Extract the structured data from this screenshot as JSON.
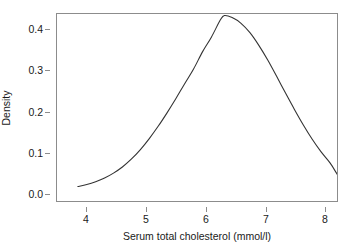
{
  "chart_data": {
    "type": "line",
    "title": "",
    "subtitle": "",
    "xlabel": "Serum total cholesterol (mmol/l)",
    "ylabel": "Density",
    "xlim": [
      3.72,
      8.45
    ],
    "ylim": [
      0.0,
      0.458
    ],
    "xticks": [
      4,
      5,
      6,
      7,
      8
    ],
    "xtick_labels": [
      "4",
      "5",
      "6",
      "7",
      "8"
    ],
    "yticks": [
      0.0,
      0.1,
      0.2,
      0.3,
      0.4
    ],
    "ytick_labels": [
      "0.0",
      "0.1",
      "0.2",
      "0.3",
      "0.4"
    ],
    "grid": false,
    "legend": null,
    "annotations": [],
    "series": [
      {
        "name": "Density",
        "color": "#333333",
        "linewidth": 1.1,
        "x": [
          3.85,
          4.0,
          4.15,
          4.3,
          4.45,
          4.6,
          4.75,
          4.9,
          5.05,
          5.2,
          5.35,
          5.5,
          5.65,
          5.8,
          5.95,
          6.1,
          6.25,
          6.32,
          6.45,
          6.6,
          6.75,
          6.9,
          7.05,
          7.2,
          7.35,
          7.5,
          7.65,
          7.8,
          7.95,
          8.1,
          8.25,
          8.35
        ],
        "y": [
          0.016,
          0.021,
          0.028,
          0.037,
          0.049,
          0.064,
          0.083,
          0.106,
          0.133,
          0.163,
          0.196,
          0.231,
          0.268,
          0.304,
          0.346,
          0.382,
          0.424,
          0.435,
          0.43,
          0.416,
          0.393,
          0.362,
          0.326,
          0.286,
          0.245,
          0.205,
          0.167,
          0.132,
          0.101,
          0.074,
          0.04,
          0.025
        ]
      }
    ]
  },
  "axes": {
    "y_ticks": [
      {
        "label": "0.4",
        "py": 29
      },
      {
        "label": "0.3",
        "py": 70
      },
      {
        "label": "0.2",
        "py": 112
      },
      {
        "label": "0.1",
        "py": 153
      },
      {
        "label": "0.0",
        "py": 194
      }
    ],
    "x_ticks": [
      {
        "label": "4",
        "px": 86
      },
      {
        "label": "5",
        "px": 146
      },
      {
        "label": "6",
        "px": 206
      },
      {
        "label": "7",
        "px": 266
      },
      {
        "label": "8",
        "px": 325
      }
    ]
  },
  "style": {
    "background": "#ffffff",
    "frame_color": "#8c8c8c",
    "text_color": "#1a1a1a",
    "curve_color": "#333333"
  }
}
